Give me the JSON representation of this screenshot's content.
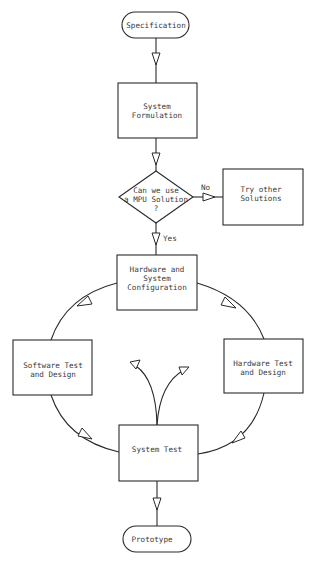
{
  "diagram": {
    "type": "flowchart",
    "nodes": {
      "specification": {
        "shape": "terminator",
        "lines": [
          "Specification"
        ]
      },
      "system_formulation": {
        "shape": "process",
        "lines": [
          "System",
          "Formulation"
        ]
      },
      "mpu_decision": {
        "shape": "decision",
        "lines": [
          "Can we use",
          "a MPU Solution",
          "?"
        ]
      },
      "try_other": {
        "shape": "process",
        "lines": [
          "Try other",
          "Solutions"
        ]
      },
      "hw_sys_config": {
        "shape": "process",
        "lines": [
          "Hardware and",
          "System",
          "Configuration"
        ]
      },
      "software_test": {
        "shape": "process",
        "lines": [
          "Software Test",
          "and Design"
        ]
      },
      "hardware_test": {
        "shape": "process",
        "lines": [
          "Hardware Test",
          "and Design"
        ]
      },
      "system_test": {
        "shape": "process",
        "lines": [
          "System Test"
        ]
      },
      "prototype": {
        "shape": "terminator",
        "lines": [
          "Prototype"
        ]
      }
    },
    "edge_labels": {
      "no": "No",
      "yes": "Yes"
    },
    "edges": [
      {
        "from": "Specification",
        "to": "System Formulation"
      },
      {
        "from": "System Formulation",
        "to": "Can we use a MPU Solution ?"
      },
      {
        "from": "Can we use a MPU Solution ?",
        "to": "Try other Solutions",
        "label": "No"
      },
      {
        "from": "Can we use a MPU Solution ?",
        "to": "Hardware and System Configuration",
        "label": "Yes"
      },
      {
        "from": "Hardware and System Configuration",
        "to": "Software Test and Design"
      },
      {
        "from": "Hardware and System Configuration",
        "to": "Hardware Test and Design"
      },
      {
        "from": "Software Test and Design",
        "to": "System Test"
      },
      {
        "from": "Hardware Test and Design",
        "to": "System Test"
      },
      {
        "from": "System Test",
        "to": "Software Test and Design",
        "style": "feedback"
      },
      {
        "from": "System Test",
        "to": "Hardware Test and Design",
        "style": "feedback"
      },
      {
        "from": "System Test",
        "to": "Prototype"
      }
    ]
  }
}
